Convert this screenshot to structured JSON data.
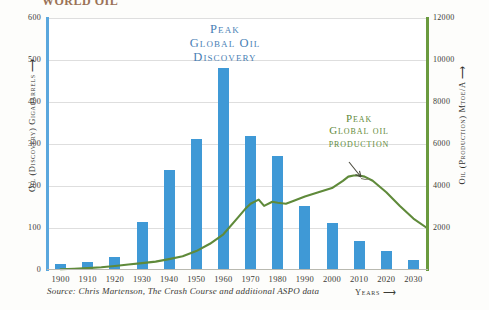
{
  "figure": {
    "cropped_title": "WORLD OIL",
    "source_note": "Source: Chris Martenson, The Crash Course and additional ASPO data",
    "years_axis_label": "Years ⟶"
  },
  "annotations": {
    "discovery": {
      "line1": "Peak",
      "line2": "Global Oil",
      "line3": "Discovery",
      "color": "#4a7fb5"
    },
    "production": {
      "line1": "Peak",
      "line2": "Global oil",
      "line3": "production",
      "color": "#5f8a3a"
    }
  },
  "axes": {
    "left": {
      "title": "Oil (Discovery) Gigabarrels ⟶",
      "ticks": [
        "0",
        "100",
        "200",
        "300",
        "400",
        "500",
        "600"
      ],
      "color": "#5aa7dd"
    },
    "right": {
      "title": "Oil (Production) Mtoe/A ⟶",
      "ticks": [
        "2000",
        "4000",
        "6000",
        "8000",
        "10000",
        "12000"
      ],
      "color": "#6a9a3e"
    },
    "bottom": {
      "ticks": [
        "1900",
        "1910",
        "1920",
        "1930",
        "1940",
        "1950",
        "1960",
        "1970",
        "1980",
        "1990",
        "2000",
        "2010",
        "2020",
        "2030"
      ]
    }
  },
  "chart_data": {
    "type": "bar",
    "xlabel": "Years",
    "ylabel": "Oil (Discovery) Gigabarrels",
    "y2label": "Oil (Production) Mtoe/A",
    "ylim": [
      0,
      600
    ],
    "y2lim": [
      0,
      12000
    ],
    "xlim": [
      1895,
      2035
    ],
    "grid": true,
    "legend": "none",
    "categories": [
      "1900",
      "1910",
      "1920",
      "1930",
      "1940",
      "1950",
      "1960",
      "1970",
      "1980",
      "1990",
      "2000",
      "2010",
      "2020",
      "2030"
    ],
    "series": [
      {
        "name": "Oil discovery (Gigabarrels per decade)",
        "type": "bar",
        "color": "#3f99d6",
        "axis": "left",
        "values": [
          15,
          20,
          30,
          115,
          238,
          312,
          480,
          320,
          272,
          152,
          112,
          68,
          45,
          25
        ]
      },
      {
        "name": "Oil production (Mtoe/A)",
        "type": "line",
        "color": "#5f8a3a",
        "axis": "right",
        "x": [
          1900,
          1905,
          1910,
          1915,
          1920,
          1925,
          1930,
          1935,
          1940,
          1945,
          1950,
          1955,
          1960,
          1965,
          1968,
          1970,
          1973,
          1975,
          1978,
          1980,
          1983,
          1985,
          1990,
          1995,
          2000,
          2004,
          2006,
          2008,
          2010,
          2012,
          2015,
          2020,
          2025,
          2030,
          2035
        ],
        "values": [
          40,
          60,
          90,
          130,
          190,
          260,
          330,
          400,
          520,
          650,
          900,
          1250,
          1700,
          2450,
          2900,
          3150,
          3350,
          3050,
          3250,
          3200,
          3150,
          3250,
          3500,
          3700,
          3900,
          4250,
          4450,
          4500,
          4500,
          4450,
          4250,
          3700,
          3050,
          2450,
          2000
        ]
      }
    ],
    "annotations": [
      {
        "text": "Peak Global Oil Discovery",
        "target_x": "1960",
        "target_y": 480,
        "color": "#4a7fb5"
      },
      {
        "text": "Peak Global oil production",
        "target_x": "2008",
        "target_y2": 4500,
        "color": "#5f8a3a"
      }
    ]
  }
}
